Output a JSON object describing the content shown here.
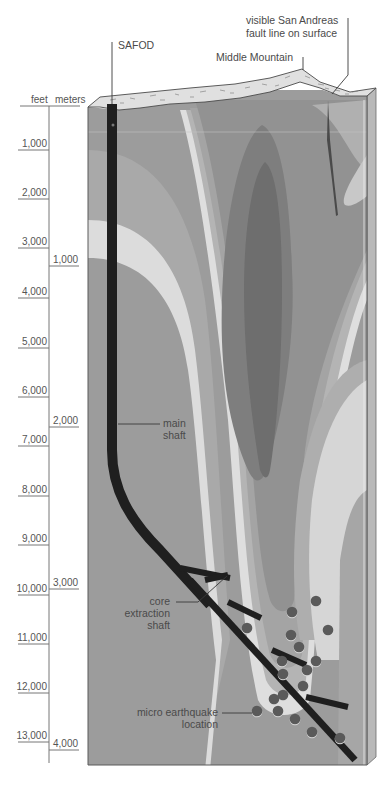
{
  "figure": {
    "colors": {
      "background": "#ffffff",
      "rock_base": "#9a9a9a",
      "band_light": "#dedede",
      "band_mid_light": "#b8b8b8",
      "band_mid": "#a3a3a3",
      "band_dark": "#8a8a8a",
      "band_darker": "#767676",
      "side_face": "#b5b5b5",
      "surface_crust": "#e2e2e2",
      "shaft": "#1e1e1e",
      "quake_dot": "#5a5a5a",
      "text": "#4a4a4a"
    }
  },
  "labels": {
    "safod": "SAFOD",
    "middle_mountain": "Middle Mountain",
    "fault_line_1": "visible San Andreas",
    "fault_line_2": "fault line on surface",
    "main_shaft_1": "main",
    "main_shaft_2": "shaft",
    "core_1": "core",
    "core_2": "extraction",
    "core_3": "shaft",
    "quake_1": "micro earthquake",
    "quake_2": "location"
  },
  "axes": {
    "feet_header": "feet",
    "meters_header": "meters",
    "feet_ticks": [
      {
        "label": "1,000",
        "y": 150
      },
      {
        "label": "2,000",
        "y": 199
      },
      {
        "label": "3,000",
        "y": 248
      },
      {
        "label": "4,000",
        "y": 298
      },
      {
        "label": "5,000",
        "y": 348
      },
      {
        "label": "6,000",
        "y": 397
      },
      {
        "label": "7,000",
        "y": 446
      },
      {
        "label": "8,000",
        "y": 496
      },
      {
        "label": "9,000",
        "y": 545
      },
      {
        "label": "10,000",
        "y": 595
      },
      {
        "label": "11,000",
        "y": 644
      },
      {
        "label": "12,000",
        "y": 693
      },
      {
        "label": "13,000",
        "y": 742
      }
    ],
    "meters_ticks": [
      {
        "label": "1,000",
        "y": 266
      },
      {
        "label": "2,000",
        "y": 427
      },
      {
        "label": "3,000",
        "y": 589
      },
      {
        "label": "4,000",
        "y": 750
      }
    ]
  },
  "earthquakes": [
    {
      "x": 316,
      "y": 601
    },
    {
      "x": 292,
      "y": 612
    },
    {
      "x": 328,
      "y": 630
    },
    {
      "x": 291,
      "y": 635
    },
    {
      "x": 299,
      "y": 647
    },
    {
      "x": 316,
      "y": 661
    },
    {
      "x": 307,
      "y": 670
    },
    {
      "x": 282,
      "y": 661
    },
    {
      "x": 283,
      "y": 674
    },
    {
      "x": 303,
      "y": 686
    },
    {
      "x": 283,
      "y": 695
    },
    {
      "x": 274,
      "y": 699
    },
    {
      "x": 257,
      "y": 711
    },
    {
      "x": 278,
      "y": 711
    },
    {
      "x": 295,
      "y": 719
    },
    {
      "x": 312,
      "y": 732
    },
    {
      "x": 340,
      "y": 738
    },
    {
      "x": 247,
      "y": 628
    }
  ]
}
